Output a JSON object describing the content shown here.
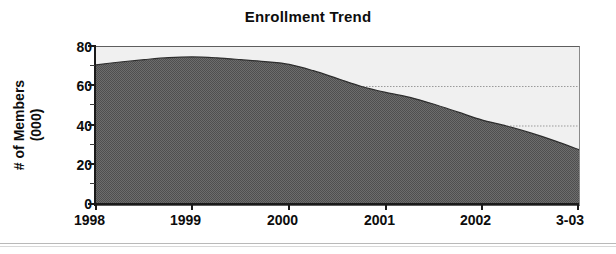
{
  "chart_data": {
    "type": "area",
    "title": "Enrollment Trend",
    "xlabel": "",
    "ylabel": "# of Members (000)",
    "ylabel_line1": "# of Members",
    "ylabel_line2": "(000)",
    "categories": [
      "1998",
      "1999",
      "2000",
      "2001",
      "2002",
      "3-03"
    ],
    "x_tick_labels": [
      "1998",
      "1999",
      "2000",
      "2001",
      "2002",
      "3-03"
    ],
    "values": [
      71,
      75,
      71,
      57,
      43,
      28
    ],
    "series": [
      {
        "name": "# of Members (000)",
        "values": [
          71,
          75,
          71,
          57,
          43,
          28
        ],
        "fill_color": "#585858",
        "line_color": "#3b3b3b"
      }
    ],
    "dense_points": [
      {
        "x": 0.0,
        "y": 71.0
      },
      {
        "x": 0.25,
        "y": 72.4
      },
      {
        "x": 0.5,
        "y": 73.6
      },
      {
        "x": 0.75,
        "y": 74.6
      },
      {
        "x": 1.0,
        "y": 75.0
      },
      {
        "x": 1.25,
        "y": 74.5
      },
      {
        "x": 1.5,
        "y": 73.6
      },
      {
        "x": 1.75,
        "y": 72.6
      },
      {
        "x": 2.0,
        "y": 71.2
      },
      {
        "x": 2.25,
        "y": 68.0
      },
      {
        "x": 2.5,
        "y": 64.0
      },
      {
        "x": 2.75,
        "y": 60.0
      },
      {
        "x": 3.0,
        "y": 57.0
      },
      {
        "x": 3.25,
        "y": 54.5
      },
      {
        "x": 3.5,
        "y": 51.0
      },
      {
        "x": 3.75,
        "y": 47.0
      },
      {
        "x": 4.0,
        "y": 43.0
      },
      {
        "x": 4.25,
        "y": 40.0
      },
      {
        "x": 4.5,
        "y": 36.5
      },
      {
        "x": 4.75,
        "y": 32.5
      },
      {
        "x": 5.0,
        "y": 28.0
      }
    ],
    "ylim": [
      0,
      80
    ],
    "y_ticks": [
      0,
      20,
      40,
      60,
      80
    ],
    "y_tick_labels": [
      "0",
      "20",
      "40",
      "60",
      "80"
    ],
    "y_minor_ticks": [
      10,
      30,
      50,
      70
    ],
    "grid": "horizontal-dotted",
    "gridlines": [
      40,
      60
    ],
    "legend": "none",
    "plot_background": "#f0f0f0"
  },
  "colors": {
    "area_fill": "#585858",
    "plot_bg": "#f0f0f0",
    "axis": "#1a1a1a",
    "text": "#0d0d0d",
    "gridline": "#9a9a9a"
  }
}
